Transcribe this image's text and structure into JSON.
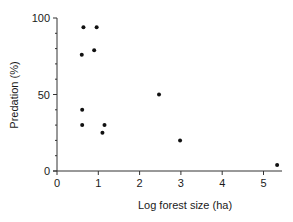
{
  "chart_data": {
    "type": "scatter",
    "title": "",
    "xlabel": "Log forest size (ha)",
    "ylabel": "Predation (%)",
    "xlim": [
      0,
      5.4
    ],
    "ylim": [
      0,
      100
    ],
    "x_ticks": [
      0,
      1,
      2,
      3,
      4,
      5
    ],
    "y_ticks": [
      0,
      50,
      100
    ],
    "y_minor_tick_step": 10,
    "grid": false,
    "legend": null,
    "series": [
      {
        "name": "sites",
        "points": [
          {
            "x": 0.64,
            "y": 94
          },
          {
            "x": 0.96,
            "y": 94
          },
          {
            "x": 0.9,
            "y": 79
          },
          {
            "x": 0.6,
            "y": 76
          },
          {
            "x": 0.61,
            "y": 40
          },
          {
            "x": 0.61,
            "y": 30
          },
          {
            "x": 1.15,
            "y": 30
          },
          {
            "x": 1.1,
            "y": 25
          },
          {
            "x": 2.47,
            "y": 50
          },
          {
            "x": 2.98,
            "y": 20
          },
          {
            "x": 5.33,
            "y": 4
          }
        ]
      }
    ]
  },
  "colors": {
    "axis": "#333333",
    "point": "#111111",
    "background": "#ffffff"
  }
}
